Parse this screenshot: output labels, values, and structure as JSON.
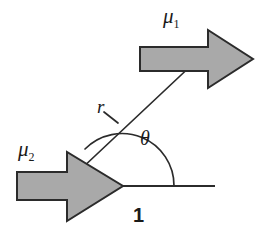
{
  "figure": {
    "type": "vector-diagram",
    "background_color": "#ffffff",
    "arrow_fill_color": "#a9a9a9",
    "arrow_stroke_color": "#2b2b2b",
    "line_color": "#2b2b2b"
  },
  "labels": {
    "mu1": {
      "symbol": "μ",
      "subscript": "1"
    },
    "mu2": {
      "symbol": "μ",
      "subscript": "2"
    },
    "r": "r",
    "theta": "θ",
    "axis": "1"
  },
  "geometry": {
    "origin": {
      "x": 122,
      "y": 186
    },
    "baseline": {
      "x1": 122,
      "y1": 186,
      "x2": 215,
      "y2": 186
    },
    "r_line": {
      "x1": 80,
      "y1": 170,
      "x2": 196,
      "y2": 61
    },
    "r_tick": {
      "x1": 104,
      "y1": 112,
      "x2": 118,
      "y2": 122
    },
    "angle_arc_radius": 52,
    "angle_degrees": 45,
    "mu1_arrow": {
      "x": 140,
      "y": 38,
      "width": 113,
      "height": 42,
      "direction": "right"
    },
    "mu2_arrow": {
      "x": 17,
      "y": 168,
      "width": 106,
      "height": 52,
      "direction": "right"
    }
  }
}
